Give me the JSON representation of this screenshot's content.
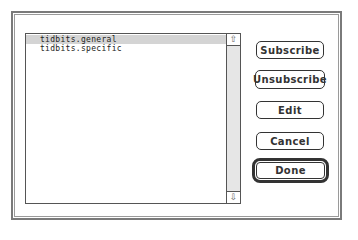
{
  "dialog": {
    "list": {
      "items": [
        {
          "label": "tidbits.general",
          "selected": true
        },
        {
          "label": "tidbits.specific",
          "selected": false
        }
      ],
      "scrollbar": {
        "up_arrow": "⇧",
        "down_arrow": "⇩"
      }
    },
    "buttons": {
      "subscribe": "Subscribe",
      "unsubscribe": "Unsubscribe",
      "edit": "Edit",
      "cancel": "Cancel",
      "done": "Done"
    }
  }
}
